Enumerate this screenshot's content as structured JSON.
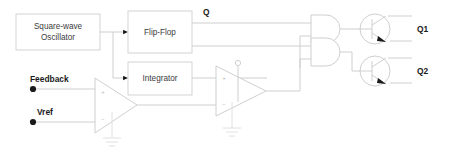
{
  "diagram": {
    "background_color": "#ffffff",
    "wire_color": "#c9c9c9",
    "box_border_color": "#cfcfcf",
    "label_color": "#3c3c3c",
    "bold_label_color": "#1a1a1a",
    "blocks": [
      {
        "id": "oscillator",
        "label_line1": "Square-wave",
        "label_line2": "Oscillator"
      },
      {
        "id": "flipflop",
        "label": "Flip-Flop"
      },
      {
        "id": "integrator",
        "label": "Integrator"
      }
    ],
    "signals": [
      {
        "id": "q-output",
        "label": "Q"
      },
      {
        "id": "q1-output",
        "label": "Q1"
      },
      {
        "id": "q2-output",
        "label": "Q2"
      }
    ],
    "inputs": [
      {
        "id": "feedback",
        "label": "Feedback"
      },
      {
        "id": "vref",
        "label": "Vref"
      }
    ],
    "opamp_signs": {
      "plus": "+",
      "minus": "−"
    },
    "gates": [
      {
        "id": "and-gate-1",
        "type": "AND",
        "inputs": 2
      },
      {
        "id": "and-gate-2",
        "type": "AND",
        "inputs": 2
      }
    ],
    "transistors": [
      {
        "id": "transistor-q1",
        "type": "NPN",
        "label": "Q1"
      },
      {
        "id": "transistor-q2",
        "type": "NPN",
        "label": "Q2"
      }
    ]
  }
}
